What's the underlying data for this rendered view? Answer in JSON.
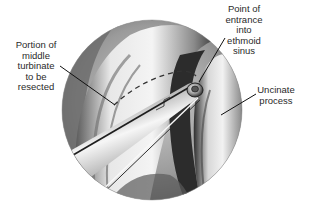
{
  "figure": {
    "type": "endoscopic-anatomical-illustration",
    "style": "grayscale pencil rendering",
    "colors": {
      "background": "#ffffff",
      "label_text": "#2a2a2a",
      "leader_line": "#111111",
      "dashed_line": "#333333"
    }
  },
  "labels": {
    "turbinate": {
      "lines": [
        "Portion of",
        "middle",
        "turbinate",
        "to be",
        "resected"
      ]
    },
    "entrance": {
      "lines": [
        "Point of",
        "entrance",
        "into",
        "ethmoid",
        "sinus"
      ]
    },
    "uncinate": {
      "lines": [
        "Uncinate",
        "process"
      ]
    }
  }
}
